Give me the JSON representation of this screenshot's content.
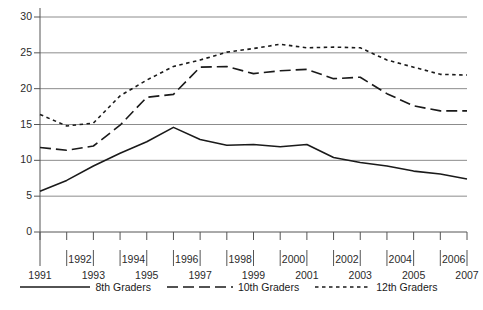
{
  "chart_data": {
    "type": "line",
    "title": "",
    "xlabel": "",
    "ylabel": "",
    "xlim": [
      1991,
      2007
    ],
    "ylim": [
      0,
      30
    ],
    "yticks": [
      0,
      5,
      10,
      15,
      20,
      25,
      30
    ],
    "grid": true,
    "legend_position": "bottom",
    "x": [
      1991,
      1992,
      1993,
      1994,
      1995,
      1996,
      1997,
      1998,
      1999,
      2000,
      2001,
      2002,
      2003,
      2004,
      2005,
      2006,
      2007
    ],
    "categories": [
      "1991",
      "1992",
      "1993",
      "1994",
      "1995",
      "1996",
      "1997",
      "1998",
      "1999",
      "2000",
      "2001",
      "2002",
      "2003",
      "2004",
      "2005",
      "2006",
      "2007"
    ],
    "series": [
      {
        "name": "8th Graders",
        "style": "solid",
        "color": "#1a1a1a",
        "values": [
          5.7,
          7.2,
          9.2,
          11.0,
          12.6,
          14.6,
          12.9,
          12.1,
          12.2,
          11.9,
          12.2,
          10.4,
          9.7,
          9.2,
          8.5,
          8.1,
          7.4
        ]
      },
      {
        "name": "10th Graders",
        "style": "dashed",
        "color": "#1a1a1a",
        "values": [
          11.8,
          11.4,
          12.0,
          14.9,
          18.8,
          19.2,
          23.0,
          23.1,
          22.1,
          22.5,
          22.7,
          21.4,
          21.6,
          19.3,
          17.6,
          16.9,
          16.9
        ]
      },
      {
        "name": "12th Graders",
        "style": "dotted",
        "color": "#1a1a1a",
        "values": [
          16.4,
          14.8,
          15.2,
          19.0,
          21.2,
          23.1,
          24.0,
          25.1,
          25.6,
          26.2,
          25.7,
          25.8,
          25.7,
          24.0,
          23.0,
          22.0,
          21.9
        ]
      }
    ]
  },
  "legend": {
    "entries": [
      {
        "label": "8th Graders",
        "style": "solid"
      },
      {
        "label": "10th Graders",
        "style": "dashed"
      },
      {
        "label": "12th Graders",
        "style": "dotted"
      }
    ]
  }
}
